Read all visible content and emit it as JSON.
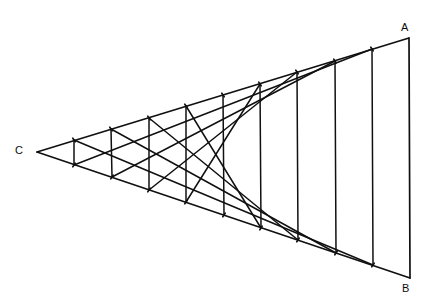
{
  "figure": {
    "kind": "geometric-line-diagram",
    "background_color": "#ffffff",
    "stroke_color": "#101010",
    "canvas": {
      "width": 438,
      "height": 302
    }
  },
  "vertices": [
    {
      "id": "A",
      "label": "A",
      "x": 409,
      "y": 38,
      "label_x": 401,
      "label_y": 22
    },
    {
      "id": "B",
      "label": "B",
      "x": 410,
      "y": 278,
      "label_x": 402,
      "label_y": 283
    },
    {
      "id": "C",
      "label": "C",
      "x": 37,
      "y": 152,
      "label_x": 15,
      "label_y": 145
    }
  ],
  "edges": [
    {
      "name": "side-CA",
      "from": "C",
      "to": "A",
      "stroke_width": 1.7
    },
    {
      "name": "side-CB",
      "from": "C",
      "to": "B",
      "stroke_width": 1.7
    },
    {
      "name": "side-AB",
      "from": "A",
      "to": "B",
      "stroke_width": 1.7
    }
  ],
  "construction": {
    "divisions": 10,
    "description": "Side CA and side CB are each divided into 10 equal parts. Point i on CA is joined to point (10 - i) on CB. The family of chords envelopes a parabola tangent to CA at A and to CB at B, with its cusp-like vertex near the middle of the angle.",
    "chord_stroke_width": 1.5,
    "envelope_cusp": {
      "x": 252,
      "y": 155
    },
    "points_on_CA": [
      {
        "index": 1,
        "x": 74,
        "y": 140
      },
      {
        "index": 2,
        "x": 111,
        "y": 129
      },
      {
        "index": 3,
        "x": 149,
        "y": 118
      },
      {
        "index": 4,
        "x": 186,
        "y": 106
      },
      {
        "index": 5,
        "x": 223,
        "y": 95
      },
      {
        "index": 6,
        "x": 260,
        "y": 84
      },
      {
        "index": 7,
        "x": 297,
        "y": 72
      },
      {
        "index": 8,
        "x": 335,
        "y": 61
      },
      {
        "index": 9,
        "x": 372,
        "y": 49
      },
      {
        "index": 10,
        "x": 409,
        "y": 38
      }
    ],
    "points_on_CB": [
      {
        "index": 1,
        "x": 74,
        "y": 165
      },
      {
        "index": 2,
        "x": 112,
        "y": 177
      },
      {
        "index": 3,
        "x": 149,
        "y": 190
      },
      {
        "index": 4,
        "x": 186,
        "y": 202
      },
      {
        "index": 5,
        "x": 224,
        "y": 215
      },
      {
        "index": 6,
        "x": 261,
        "y": 228
      },
      {
        "index": 7,
        "x": 298,
        "y": 240
      },
      {
        "index": 8,
        "x": 336,
        "y": 253
      },
      {
        "index": 9,
        "x": 373,
        "y": 265
      },
      {
        "index": 10,
        "x": 410,
        "y": 278
      }
    ],
    "chords": [
      {
        "from_ca_index": 1,
        "to_cb_index": 9
      },
      {
        "from_ca_index": 2,
        "to_cb_index": 8
      },
      {
        "from_ca_index": 3,
        "to_cb_index": 7
      },
      {
        "from_ca_index": 4,
        "to_cb_index": 6
      },
      {
        "from_ca_index": 5,
        "to_cb_index": 5
      },
      {
        "from_ca_index": 6,
        "to_cb_index": 4
      },
      {
        "from_ca_index": 7,
        "to_cb_index": 3
      },
      {
        "from_ca_index": 8,
        "to_cb_index": 2
      },
      {
        "from_ca_index": 9,
        "to_cb_index": 1
      },
      {
        "from_ca_index": 1,
        "to_cb_index": 1
      },
      {
        "from_ca_index": 2,
        "to_cb_index": 2
      },
      {
        "from_ca_index": 3,
        "to_cb_index": 3
      },
      {
        "from_ca_index": 4,
        "to_cb_index": 4
      },
      {
        "from_ca_index": 6,
        "to_cb_index": 6
      },
      {
        "from_ca_index": 7,
        "to_cb_index": 7
      },
      {
        "from_ca_index": 8,
        "to_cb_index": 8
      },
      {
        "from_ca_index": 9,
        "to_cb_index": 9
      }
    ]
  }
}
